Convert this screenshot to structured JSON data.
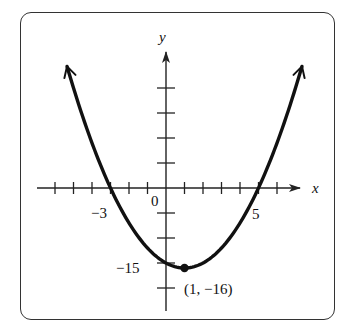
{
  "chart_data": {
    "type": "line",
    "title": "",
    "function": "y = x^2 - 2x - 15",
    "vertex_form": "y = (x - 1)^2 - 16",
    "xlabel": "x",
    "ylabel": "y",
    "x_tick_step": 1,
    "y_tick_step": 5,
    "x_ticks_visible": [
      -6,
      -5,
      -4,
      -3,
      -2,
      -1,
      1,
      2,
      3,
      4,
      5,
      6
    ],
    "y_ticks_visible": [
      -20,
      -15,
      -10,
      -5,
      5,
      10,
      15,
      20
    ],
    "xlim": [
      -7,
      8
    ],
    "ylim": [
      -25,
      30
    ],
    "grid": false,
    "labeled_ticks": {
      "x": [
        {
          "value": -3,
          "label": "−3"
        },
        {
          "value": 0,
          "label": "0"
        },
        {
          "value": 5,
          "label": "5"
        }
      ],
      "y": [
        {
          "value": -15,
          "label": "−15"
        }
      ]
    },
    "annotations": [
      {
        "point": [
          1,
          -16
        ],
        "label": "(1, −16)",
        "marker": "filled-circle"
      }
    ],
    "x": [
      -5.35,
      -5,
      -4,
      -3,
      -2,
      -1,
      0,
      1,
      2,
      3,
      4,
      5,
      6,
      7,
      7.35
    ],
    "y": [
      24.3,
      20,
      9,
      0,
      -7,
      -12,
      -15,
      -16,
      -15,
      -12,
      -7,
      0,
      9,
      20,
      24.3
    ],
    "x_intercepts": [
      -3,
      5
    ],
    "y_intercept": -15,
    "vertex": [
      1,
      -16
    ],
    "arrows_at_ends": true
  },
  "labels": {
    "x_axis": "x",
    "y_axis": "y",
    "tick_neg3": "−3",
    "tick_0": "0",
    "tick_5": "5",
    "tick_neg15": "−15",
    "vertex_label": "(1, −16)"
  },
  "colors": {
    "curve": "#111111",
    "axes": "#222222",
    "frame": "#333333",
    "background": "#ffffff"
  }
}
